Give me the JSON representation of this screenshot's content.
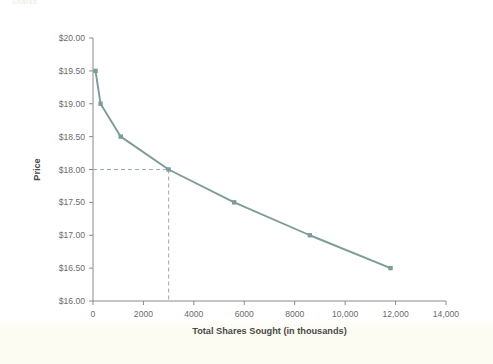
{
  "page": {
    "cut_off_header_text": "Shares",
    "background_color": "#ffffff",
    "tint_color": "#fcfbf0"
  },
  "chart_data": {
    "type": "line",
    "title": "",
    "xlabel": "Total Shares Sought (in thousands)",
    "ylabel": "Price",
    "xlim": [
      0,
      14000
    ],
    "ylim": [
      16.0,
      20.0
    ],
    "grid": false,
    "legend": "none",
    "line_color": "#7d9b99",
    "marker_color": "#7d9b99",
    "guide_color": "#9aabaa",
    "x": [
      100,
      300,
      1100,
      3000,
      5600,
      8600,
      11800
    ],
    "values": [
      19.5,
      19.0,
      18.5,
      18.0,
      17.5,
      17.0,
      16.5
    ],
    "series": [
      {
        "name": "Demand curve",
        "points": [
          {
            "x": 100,
            "y": 19.5
          },
          {
            "x": 300,
            "y": 19.0
          },
          {
            "x": 1100,
            "y": 18.5
          },
          {
            "x": 3000,
            "y": 18.0
          },
          {
            "x": 5600,
            "y": 17.5
          },
          {
            "x": 8600,
            "y": 17.0
          },
          {
            "x": 11800,
            "y": 16.5
          }
        ]
      }
    ],
    "annotations": [
      {
        "type": "guide-lines",
        "style": "dashed",
        "x": 3000,
        "y": 18.0,
        "description": "Dashed horizontal line from y-axis at $18.00 and vertical line down to x-axis at 3000"
      }
    ],
    "xticks": [
      0,
      2000,
      4000,
      6000,
      8000,
      10000,
      12000,
      14000
    ],
    "xticklabels": [
      "0",
      "2000",
      "4000",
      "6000",
      "8000",
      "10,000",
      "12,000",
      "14,000"
    ],
    "yticks": [
      16.0,
      16.5,
      17.0,
      17.5,
      18.0,
      18.5,
      19.0,
      19.5,
      20.0
    ],
    "yticklabels": [
      "$16.00",
      "$16.50",
      "$17.00",
      "$17.50",
      "$18.00",
      "$18.50",
      "$19.00",
      "$19.50",
      "$20.00"
    ]
  }
}
